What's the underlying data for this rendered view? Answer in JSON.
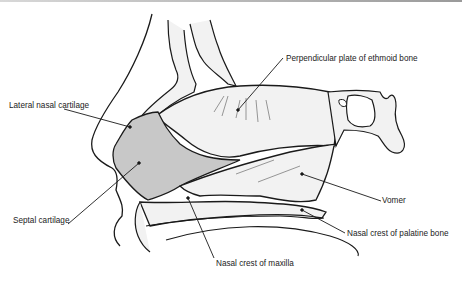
{
  "diagram": {
    "labels": [
      {
        "id": "perpendicular-plate",
        "text": "Perpendicular plate of ethmoid bone"
      },
      {
        "id": "lateral-nasal-cartilage",
        "text": "Lateral nasal cartilage"
      },
      {
        "id": "vomer",
        "text": "Vomer"
      },
      {
        "id": "septal-cartilage",
        "text": "Septal cartilage"
      },
      {
        "id": "nasal-crest-palatine",
        "text": "Nasal crest of palatine bone"
      },
      {
        "id": "nasal-crest-maxilla",
        "text": "Nasal crest of maxilla"
      }
    ],
    "colors": {
      "line": "#1a1a1a",
      "septal_cartilage_fill": "#c8c8c8",
      "bone_fill": "#f2f2f2",
      "background": "#ffffff"
    }
  }
}
